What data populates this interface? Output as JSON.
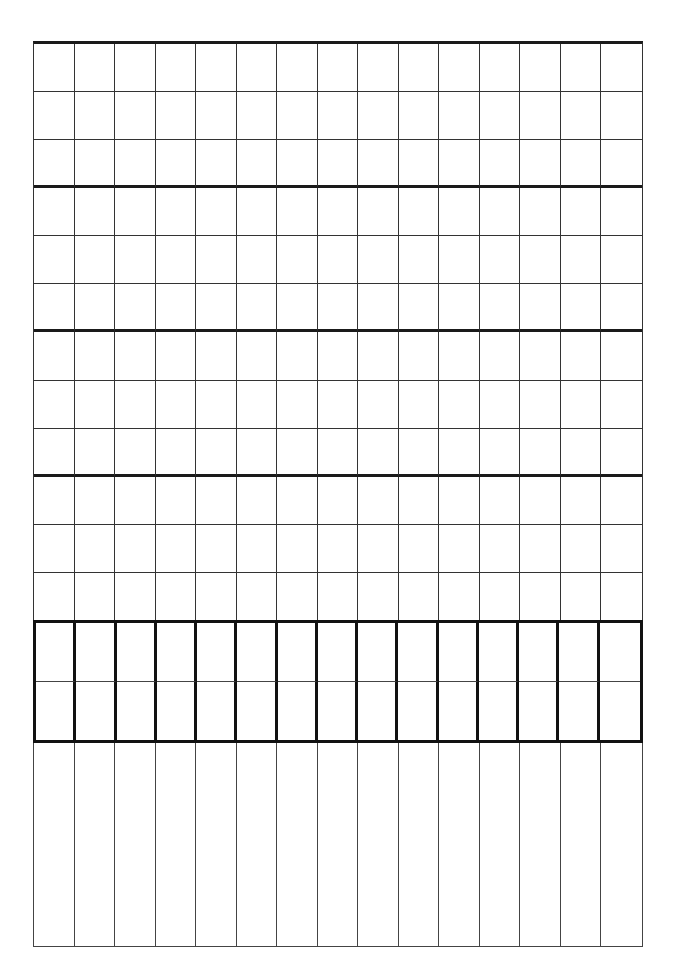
{
  "document": {
    "type": "blank ruled grid worksheet",
    "line_color": "#333333",
    "thick_line_color": "#111111",
    "background": "#ffffff"
  },
  "grid": {
    "columns": 15,
    "upper_section": {
      "rows": 12,
      "rows_per_group": 3,
      "groups": 4
    },
    "band_section": {
      "rows": 2,
      "border": "thick"
    },
    "lower_section": {
      "rows": 1,
      "style": "open columns"
    }
  }
}
